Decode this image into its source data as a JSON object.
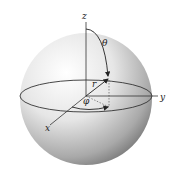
{
  "diagram": {
    "type": "spherical-coordinates",
    "labels": {
      "z_axis": "z",
      "y_axis": "y",
      "x_axis": "x",
      "radius": "r",
      "polar_angle": "θ",
      "azimuth_angle": "φ"
    },
    "colors": {
      "sphere_light": "#ffffff",
      "sphere_dark": "#6e6e6e",
      "lines": "#222222"
    }
  }
}
